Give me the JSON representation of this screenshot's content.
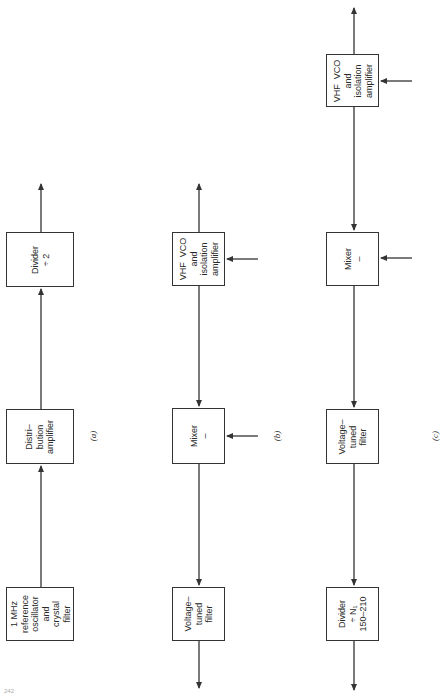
{
  "page_number": "242",
  "diagrams": {
    "a": {
      "caption": "(a)",
      "blocks": [
        {
          "id": "ref-osc",
          "label": "1 MHz\nreference\noscillator\nand\ncrystal\nfilter"
        },
        {
          "id": "dist-amp",
          "label": "Distri–\nbution\namplifier"
        },
        {
          "id": "divider-2",
          "label": "Divider\n÷ 2"
        }
      ]
    },
    "b": {
      "caption": "(b)",
      "blocks": [
        {
          "id": "vhf-vco",
          "label": "VHF  VCO\nand\nisolation\namplifier"
        },
        {
          "id": "mixer",
          "label": "Mixer\n–"
        },
        {
          "id": "vt-filter",
          "label": "Voltage–\ntuned\nfilter"
        }
      ]
    },
    "c": {
      "caption": "(c)",
      "blocks": [
        {
          "id": "vhf-vco",
          "label": "VHF  VCO\nand\nisolation\namplifier"
        },
        {
          "id": "mixer",
          "label": "Mixer\n–"
        },
        {
          "id": "vt-filter",
          "label": "Voltage–\ntuned\nfilter"
        },
        {
          "id": "divider-n1",
          "label": "Divider\n÷ N₁\n150–210"
        }
      ]
    }
  },
  "colors": {
    "line": "#333333",
    "background": "#ffffff"
  }
}
